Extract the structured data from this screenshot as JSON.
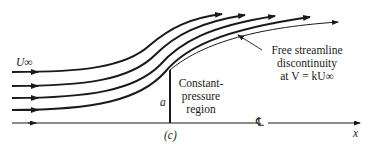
{
  "figure": {
    "label": "(c)",
    "freestream_label": "U∞",
    "plate_height_label": "a",
    "centerline_symbol": "℄",
    "axis_label": "x",
    "region_label_lines": [
      "Constant-",
      "pressure",
      "region"
    ],
    "free_streamline_label_lines": [
      "Free streamline",
      "discontinuity",
      "at V = kU∞"
    ],
    "streamline_count": 5,
    "colors": {
      "ink": "#1a1a1a",
      "background": "#ffffff"
    }
  }
}
